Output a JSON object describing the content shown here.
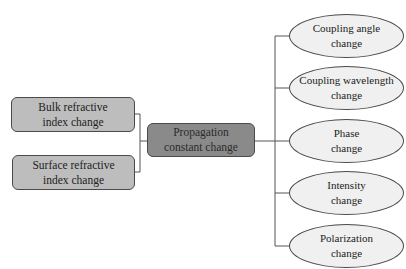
{
  "diagram": {
    "inputs": [
      {
        "line1": "Bulk refractive",
        "line2": "index change"
      },
      {
        "line1": "Surface refractive",
        "line2": "index change"
      }
    ],
    "center": {
      "line1": "Propagation",
      "line2": "constant change"
    },
    "outputs": [
      {
        "line1": "Coupling angle",
        "line2": "change"
      },
      {
        "line1": "Coupling wavelength",
        "line2": "change"
      },
      {
        "line1": "Phase",
        "line2": "change"
      },
      {
        "line1": "Intensity",
        "line2": "change"
      },
      {
        "line1": "Polarization",
        "line2": "change"
      }
    ],
    "colors": {
      "input_fill": "#bdbdbd",
      "center_fill": "#8a8a8a",
      "output_fill": "#f0f0f0",
      "stroke": "#4a4a4a"
    }
  }
}
